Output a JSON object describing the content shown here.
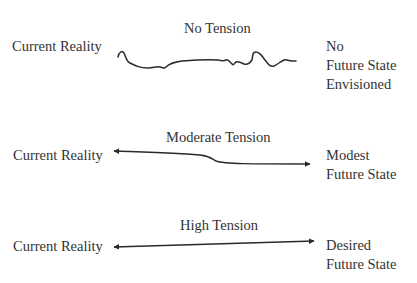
{
  "diagram": {
    "line_color": "#2a2a2a",
    "text_color": "#333333",
    "rows": [
      {
        "tension_label": "No Tension",
        "left_label": "Current Reality",
        "right_label_lines": [
          "No",
          "Future State",
          "Envisioned"
        ],
        "connector": "wavy-line-no-arrows"
      },
      {
        "tension_label": "Moderate Tension",
        "left_label": "Current Reality",
        "right_label_lines": [
          "Modest",
          "Future State"
        ],
        "connector": "curved-double-arrow"
      },
      {
        "tension_label": "High Tension",
        "left_label": "Current Reality",
        "right_label_lines": [
          "Desired",
          "Future State"
        ],
        "connector": "straight-double-arrow"
      }
    ]
  }
}
